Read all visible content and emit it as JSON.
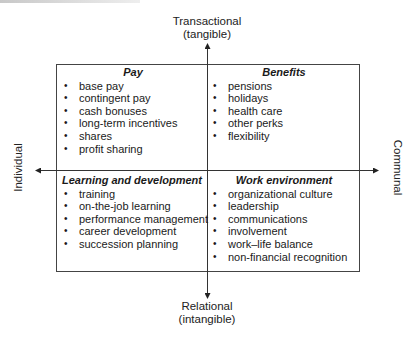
{
  "diagram": {
    "type": "2x2 matrix",
    "axes": {
      "top": {
        "line1": "Transactional",
        "line2": "(tangible)"
      },
      "bottom": {
        "line1": "Relational",
        "line2": "(intangible)"
      },
      "left": "Individual",
      "right": "Communal"
    },
    "quadrants": {
      "top_left": {
        "title": "Pay",
        "items": [
          "base pay",
          "contingent pay",
          "cash bonuses",
          "long-term incentives",
          "shares",
          "profit sharing"
        ]
      },
      "top_right": {
        "title": "Benefits",
        "items": [
          "pensions",
          "holidays",
          "health care",
          "other perks",
          "flexibility"
        ]
      },
      "bottom_left": {
        "title": "Learning and development",
        "items": [
          "training",
          "on-the-job learning",
          "performance management",
          "career development",
          "succession planning"
        ]
      },
      "bottom_right": {
        "title": "Work environment",
        "items": [
          "organizational culture",
          "leadership",
          "communications",
          "involvement",
          "work–life balance",
          "non-financial recognition"
        ]
      }
    },
    "bullet": "•",
    "colors": {
      "line": "#333333",
      "box": "#444444",
      "text": "#1a1a1a"
    }
  }
}
